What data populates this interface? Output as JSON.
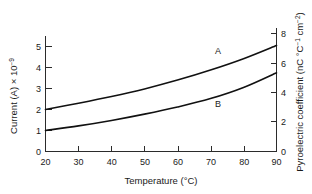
{
  "chart_data": {
    "type": "line",
    "title": "",
    "xlabel": "Temperature (°C)",
    "ylabel": "Current (A) × 10",
    "ylabel_exponent": "−9",
    "ylabel_right": "Pyroelectric coefficient (nC °C",
    "ylabel_right_exp1": "−1",
    "ylabel_right_mid": " cm",
    "ylabel_right_exp2": "−2",
    "ylabel_right_end": ")",
    "xlim": [
      20,
      90
    ],
    "ylim": [
      0,
      5
    ],
    "ylim_right": [
      0,
      8
    ],
    "xticks": [
      "20",
      "30",
      "40",
      "50",
      "60",
      "70",
      "80",
      "90"
    ],
    "xtick_values": [
      20,
      30,
      40,
      50,
      60,
      70,
      80,
      90
    ],
    "yticks": [
      "0",
      "1",
      "2",
      "3",
      "4",
      "5"
    ],
    "ytick_values": [
      0,
      1,
      2,
      3,
      4,
      5
    ],
    "yticks_right": [
      "0",
      "2",
      "4",
      "6",
      "8"
    ],
    "ytick_values_right": [
      0,
      2,
      4,
      6,
      8
    ],
    "grid": false,
    "legend": "inline-curve-labels",
    "x": [
      20,
      30,
      40,
      50,
      60,
      70,
      80,
      90
    ],
    "series": [
      {
        "name": "A",
        "label": "A",
        "label_x": 75,
        "label_y": 4.35,
        "color": "#111111",
        "axis": "left",
        "values": [
          2.0,
          2.3,
          2.62,
          2.98,
          3.4,
          3.88,
          4.42,
          5.05
        ],
        "values_right_axis": [
          3.2,
          3.68,
          4.2,
          4.76,
          5.44,
          6.2,
          7.08,
          8.08
        ]
      },
      {
        "name": "B",
        "label": "B",
        "label_x": 75,
        "label_y": 2.85,
        "color": "#111111",
        "axis": "left",
        "values": [
          1.0,
          1.22,
          1.48,
          1.78,
          2.12,
          2.52,
          3.05,
          3.75
        ],
        "values_right_axis": [
          1.6,
          1.95,
          2.37,
          2.85,
          3.39,
          4.03,
          4.88,
          6.0
        ]
      }
    ],
    "colors": {
      "curve": "#111111",
      "axis": "#2b2b2b",
      "background": "#ffffff",
      "text": "#1a1a1a"
    }
  }
}
